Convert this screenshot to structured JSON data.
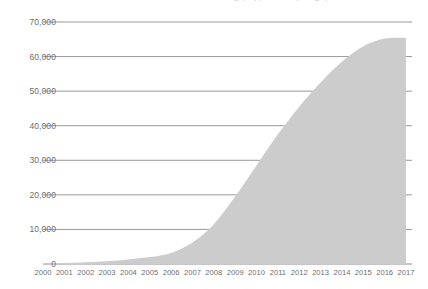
{
  "title_clipped": "Cumulative total — chart heading (clipped at top edge)",
  "chart_data": {
    "type": "area",
    "title": "",
    "xlabel": "",
    "ylabel": "",
    "x": [
      2000,
      2001,
      2002,
      2003,
      2004,
      2005,
      2006,
      2007,
      2008,
      2009,
      2010,
      2011,
      2012,
      2013,
      2014,
      2015,
      2016,
      2017
    ],
    "categories": [
      "2000",
      "2001",
      "2002",
      "2003",
      "2004",
      "2005",
      "2006",
      "2007",
      "2008",
      "2009",
      "2010",
      "2011",
      "2012",
      "2013",
      "2014",
      "2015",
      "2016",
      "2017"
    ],
    "values": [
      150,
      300,
      500,
      800,
      1300,
      2000,
      3200,
      6200,
      11500,
      19500,
      28500,
      37500,
      45500,
      52500,
      58500,
      63000,
      65200,
      65400
    ],
    "ylim": [
      0,
      70000
    ],
    "yticks": [
      0,
      10000,
      20000,
      30000,
      40000,
      50000,
      60000,
      70000
    ],
    "ytick_labels": [
      "0",
      "10,000",
      "20,000",
      "30,000",
      "40,000",
      "50,000",
      "60,000",
      "70,000"
    ],
    "xlim": [
      2000,
      2017
    ],
    "grid": true,
    "legend": "none",
    "series_fill_color": "#cccccc",
    "gridline_color": "#8d8d92",
    "axis_text_color": "#6d6d72"
  },
  "geometry": {
    "plot_left": 43,
    "plot_right": 412,
    "data_right": 406,
    "plot_top": 22,
    "plot_bottom": 264
  }
}
